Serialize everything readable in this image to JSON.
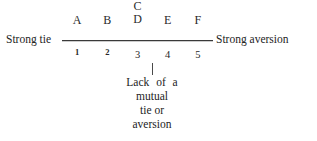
{
  "figure": {
    "left_label": "Strong tie",
    "right_label": "Strong aversion",
    "leader_icon": "vertical-leader-line"
  },
  "scale": {
    "points": [
      {
        "letter": "A",
        "letter_above": "",
        "number": "1"
      },
      {
        "letter": "B",
        "letter_above": "",
        "number": "2"
      },
      {
        "letter": "D",
        "letter_above": "C",
        "number": "3"
      },
      {
        "letter": "E",
        "letter_above": "",
        "number": "4"
      },
      {
        "letter": "F",
        "letter_above": "",
        "number": "5"
      }
    ]
  },
  "caption": {
    "lines": [
      "Lack of a",
      "mutual",
      "tie or",
      "aversion"
    ]
  },
  "colors": {
    "background": "#ffffff",
    "text": "#232323",
    "axis": "#3a3a3a"
  }
}
